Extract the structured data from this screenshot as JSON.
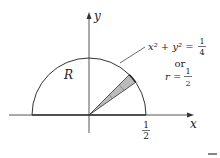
{
  "diagram": {
    "axes": {
      "x_label": "x",
      "y_label": "y"
    },
    "region_label": "R",
    "x_tick": {
      "num": "1",
      "den": "2"
    },
    "annotation": {
      "equation_lhs": "x² + y² =",
      "equation_num": "1",
      "equation_den": "4",
      "or_text": "or",
      "polar_lhs": "r =",
      "polar_num": "1",
      "polar_den": "2"
    },
    "shape": "upper semicircle of radius 1/2 centered at origin with a shaded polar wedge",
    "colors": {
      "stroke": "#333333",
      "wedge_fill": "#bbbbbb"
    }
  }
}
